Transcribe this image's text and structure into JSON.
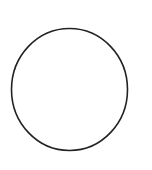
{
  "canvas": {
    "width": 152,
    "height": 170,
    "background": "#ffffff"
  },
  "shapes": [
    {
      "type": "ellipse",
      "name": "circle-outline",
      "cx": 69.5,
      "cy": 89.5,
      "rx": 58,
      "ry": 61,
      "stroke": "#222222",
      "stroke_width": 1.6,
      "fill": "none"
    }
  ]
}
